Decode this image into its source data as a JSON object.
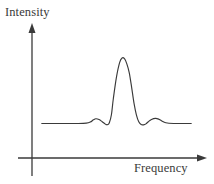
{
  "figure": {
    "name": "spectrum-line-plot",
    "background_color": "#ffffff",
    "line_color": "#3a3a3a",
    "axis_color": "#3a3a3a"
  },
  "axes": {
    "y_label": "Intensity",
    "x_label": "Frequency",
    "y_axis_name": "intensity-axis",
    "x_axis_name": "frequency-axis",
    "origin": {
      "x": 32,
      "y": 158
    },
    "y_axis_top": {
      "x": 32,
      "y": 24
    },
    "y_axis_bottom": {
      "x": 32,
      "y": 176
    },
    "x_axis_right": {
      "x": 206,
      "y": 158
    },
    "arrowheads": [
      "y-axis-arrow",
      "x-axis-arrow"
    ]
  },
  "chart_data": {
    "type": "line",
    "title": "",
    "xlabel": "Frequency",
    "ylabel": "Intensity",
    "grid": false,
    "legend": null,
    "tick_labels": {
      "x": [],
      "y": []
    },
    "axis_ranges": {
      "x": [
        0,
        1
      ],
      "y": [
        0,
        1
      ]
    },
    "series": [
      {
        "name": "intensity-trace",
        "baseline": 0.1,
        "peak_center": 0.53,
        "peak_height": 1.0,
        "side_lobe_left_center": 0.37,
        "side_lobe_right_center": 0.72,
        "side_lobe_height": 0.17,
        "x": [
          0.03,
          0.1,
          0.18,
          0.26,
          0.31,
          0.335,
          0.355,
          0.37,
          0.39,
          0.41,
          0.425,
          0.435,
          0.445,
          0.455,
          0.468,
          0.48,
          0.5,
          0.52,
          0.535,
          0.55,
          0.565,
          0.58,
          0.595,
          0.61,
          0.625,
          0.64,
          0.655,
          0.67,
          0.685,
          0.7,
          0.72,
          0.745,
          0.765,
          0.785,
          0.81,
          0.86,
          0.92,
          0.97
        ],
        "y": [
          0.1,
          0.1,
          0.1,
          0.1,
          0.105,
          0.12,
          0.15,
          0.165,
          0.155,
          0.125,
          0.1,
          0.085,
          0.085,
          0.11,
          0.22,
          0.44,
          0.74,
          0.94,
          1.0,
          0.99,
          0.92,
          0.8,
          0.6,
          0.38,
          0.22,
          0.125,
          0.085,
          0.082,
          0.095,
          0.125,
          0.155,
          0.17,
          0.16,
          0.135,
          0.11,
          0.1,
          0.1,
          0.1
        ]
      }
    ]
  }
}
